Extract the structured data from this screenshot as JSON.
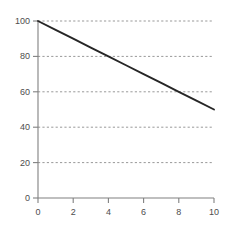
{
  "chart_data": {
    "type": "line",
    "title": "",
    "subtitle": "",
    "xlabel": "",
    "ylabel": "",
    "xlim": [
      0,
      10
    ],
    "ylim": [
      0,
      100
    ],
    "grid": "horizontal-dotted",
    "legend": "none",
    "background_color": "#ffffff",
    "line_color": "#262626",
    "grid_color": "#999999",
    "axis_color": "#808080",
    "tick_label_color": "#4d4d4d",
    "x_ticks": [
      0,
      2,
      4,
      6,
      8,
      10
    ],
    "y_ticks": [
      0,
      20,
      40,
      60,
      80,
      100
    ],
    "x_tick_labels": [
      "0",
      "2",
      "4",
      "6",
      "8",
      "10"
    ],
    "y_tick_labels": [
      "0",
      "20",
      "40",
      "60",
      "80",
      "100"
    ],
    "series": [
      {
        "name": "line",
        "x": [
          0,
          10
        ],
        "values": [
          100,
          50
        ],
        "points": [
          {
            "x": 0,
            "y": 100
          },
          {
            "x": 1,
            "y": 95
          },
          {
            "x": 2,
            "y": 90
          },
          {
            "x": 3,
            "y": 85
          },
          {
            "x": 4,
            "y": 80
          },
          {
            "x": 5,
            "y": 75
          },
          {
            "x": 6,
            "y": 70
          },
          {
            "x": 7,
            "y": 65
          },
          {
            "x": 8,
            "y": 60
          },
          {
            "x": 9,
            "y": 55
          },
          {
            "x": 10,
            "y": 50
          }
        ]
      }
    ]
  }
}
